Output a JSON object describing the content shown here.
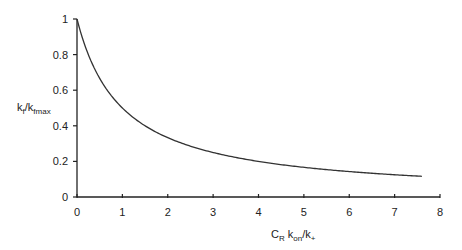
{
  "chart_data": {
    "type": "line",
    "title": "",
    "xlabel": "C_R k_on/k_+",
    "ylabel": "k_f/k_fmax",
    "xlim": [
      0,
      8
    ],
    "ylim": [
      0,
      1
    ],
    "xticks": [
      0,
      1,
      2,
      3,
      4,
      5,
      6,
      7,
      8
    ],
    "yticks": [
      0,
      0.2,
      0.4,
      0.6,
      0.8,
      1
    ],
    "grid": false,
    "legend": null,
    "series": [
      {
        "name": "k_f/k_fmax",
        "x": [
          0,
          0.25,
          0.5,
          0.75,
          1,
          1.5,
          2,
          2.5,
          3,
          3.5,
          4,
          4.5,
          5,
          5.5,
          6,
          6.5,
          7,
          7.6
        ],
        "y": [
          1,
          0.8,
          0.667,
          0.571,
          0.5,
          0.4,
          0.333,
          0.286,
          0.25,
          0.222,
          0.2,
          0.182,
          0.167,
          0.154,
          0.143,
          0.133,
          0.125,
          0.116
        ]
      }
    ]
  },
  "axes": {
    "ylabel_main": "k",
    "ylabel_sub1": "f",
    "ylabel_mid": "/k",
    "ylabel_sub2": "fmax",
    "xlabel_c": "C",
    "xlabel_sub_r": "R",
    "xlabel_k": " k",
    "xlabel_sub_on": "on",
    "xlabel_rest": "/k",
    "xlabel_sub_plus": "+"
  },
  "colors": {
    "line": "#333333",
    "axis": "#222222"
  }
}
